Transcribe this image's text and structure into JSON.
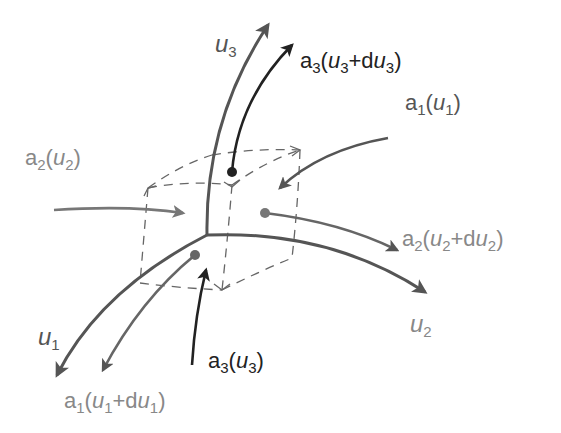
{
  "diagram": {
    "colors": {
      "axis": "#555555",
      "dark_vector": "#222222",
      "mid_vector": "#666666",
      "light_vector": "#888888",
      "dashed_cube": "#666666",
      "background": "#ffffff"
    },
    "axes": [
      {
        "id": "u1",
        "label_base": "u",
        "label_sub": "1"
      },
      {
        "id": "u2",
        "label_base": "u",
        "label_sub": "2"
      },
      {
        "id": "u3",
        "label_base": "u",
        "label_sub": "3"
      }
    ],
    "vectors": [
      {
        "id": "a3_u3_du3",
        "label": "a3(u3+du3)",
        "base": "a",
        "sub": "3",
        "arg_var": "u",
        "arg_sub": "3",
        "plus": "+d",
        "tone": "dark"
      },
      {
        "id": "a1_u1",
        "label": "a1(u1)",
        "base": "a",
        "sub": "1",
        "arg_var": "u",
        "arg_sub": "1",
        "tone": "mid"
      },
      {
        "id": "a2_u2",
        "label": "a2(u2)",
        "base": "a",
        "sub": "2",
        "arg_var": "u",
        "arg_sub": "2",
        "tone": "light"
      },
      {
        "id": "a2_u2_du2",
        "label": "a2(u2+du2)",
        "base": "a",
        "sub": "2",
        "arg_var": "u",
        "arg_sub": "2",
        "plus": "+d",
        "tone": "mid"
      },
      {
        "id": "a3_u3",
        "label": "a3(u3)",
        "base": "a",
        "sub": "3",
        "arg_var": "u",
        "arg_sub": "3",
        "tone": "dark"
      },
      {
        "id": "a1_u1_du1",
        "label": "a1(u1+du1)",
        "base": "a",
        "sub": "1",
        "arg_var": "u",
        "arg_sub": "1",
        "plus": "+d",
        "tone": "mid"
      }
    ],
    "text": {
      "open": "(",
      "close": ")",
      "plus_d": "+d"
    }
  }
}
